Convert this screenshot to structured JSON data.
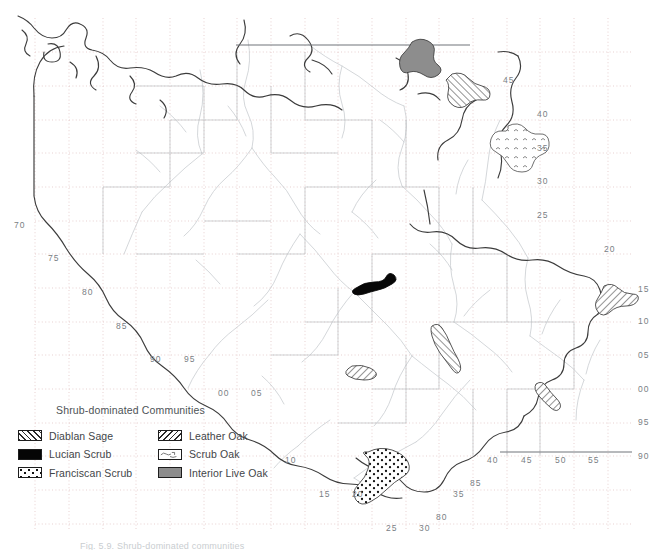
{
  "figure": {
    "caption": "Fig. 5.9. Shrub-dominated communities",
    "background_color": "#ffffff"
  },
  "legend": {
    "title": "Shrub-dominated Communities",
    "columns": [
      {
        "items": [
          {
            "label": "Diablan Sage",
            "pattern": "diagonal-hatch-forward",
            "color": "#2b2b2b"
          },
          {
            "label": "Lucian Scrub",
            "pattern": "solid-black",
            "color": "#050505"
          },
          {
            "label": "Franciscan Scrub",
            "pattern": "stipple-dots",
            "color": "#111111"
          }
        ]
      },
      {
        "items": [
          {
            "label": "Leather Oak",
            "pattern": "diagonal-hatch-back",
            "color": "#2b2b2b"
          },
          {
            "label": "Scrub Oak",
            "pattern": "sparse-marks",
            "color": "#555555"
          },
          {
            "label": "Interior Live Oak",
            "pattern": "solid-gray",
            "color": "#8d8d8d"
          }
        ]
      }
    ]
  },
  "map": {
    "line_colors": {
      "boundary": "#3b3b3b",
      "coastline": "#444444",
      "rivers": "#c2c6c9",
      "county": "#b9bdc0",
      "grid": "#d9a9a9",
      "state_line": "#6f7477"
    },
    "grid_ticks": [
      {
        "id": "t-45",
        "label": "45",
        "x": 503,
        "y": 76
      },
      {
        "id": "t-40a",
        "label": "40",
        "x": 537,
        "y": 110
      },
      {
        "id": "t-35",
        "label": "35",
        "x": 537,
        "y": 144
      },
      {
        "id": "t-30",
        "label": "30",
        "x": 537,
        "y": 177
      },
      {
        "id": "t-25",
        "label": "25",
        "x": 537,
        "y": 211
      },
      {
        "id": "t-20",
        "label": "20",
        "x": 604,
        "y": 245
      },
      {
        "id": "t-15",
        "label": "15",
        "x": 638,
        "y": 285
      },
      {
        "id": "t-10",
        "label": "10",
        "x": 638,
        "y": 317
      },
      {
        "id": "t-05",
        "label": "05",
        "x": 638,
        "y": 351
      },
      {
        "id": "t-00",
        "label": "00",
        "x": 638,
        "y": 385
      },
      {
        "id": "t-95",
        "label": "95",
        "x": 638,
        "y": 418
      },
      {
        "id": "t-90",
        "label": "90",
        "x": 638,
        "y": 452
      },
      {
        "id": "t-70",
        "label": "70",
        "x": 14,
        "y": 221
      },
      {
        "id": "t-75",
        "label": "75",
        "x": 48,
        "y": 254
      },
      {
        "id": "t-80",
        "label": "80",
        "x": 82,
        "y": 288
      },
      {
        "id": "t-85",
        "label": "85",
        "x": 116,
        "y": 322
      },
      {
        "id": "t-90b",
        "label": "90",
        "x": 150,
        "y": 355
      },
      {
        "id": "t-95b",
        "label": "95",
        "x": 184,
        "y": 355
      },
      {
        "id": "t-00b",
        "label": "00",
        "x": 218,
        "y": 389
      },
      {
        "id": "t-05b",
        "label": "05",
        "x": 251,
        "y": 389
      },
      {
        "id": "t-10b",
        "label": "10",
        "x": 285,
        "y": 456
      },
      {
        "id": "t-15b",
        "label": "15",
        "x": 319,
        "y": 490
      },
      {
        "id": "t-20b",
        "label": "20",
        "x": 352,
        "y": 490
      },
      {
        "id": "t-25b",
        "label": "25",
        "x": 386,
        "y": 524
      },
      {
        "id": "t-30b",
        "label": "30",
        "x": 419,
        "y": 524
      },
      {
        "id": "t-35b",
        "label": "35",
        "x": 453,
        "y": 490
      },
      {
        "id": "t-80c",
        "label": "80",
        "x": 436,
        "y": 513
      },
      {
        "id": "t-85c",
        "label": "85",
        "x": 470,
        "y": 479
      },
      {
        "id": "t-40b",
        "label": "40",
        "x": 487,
        "y": 456
      },
      {
        "id": "t-45b",
        "label": "45",
        "x": 521,
        "y": 456
      },
      {
        "id": "t-50b",
        "label": "50",
        "x": 555,
        "y": 456
      },
      {
        "id": "t-55b",
        "label": "55",
        "x": 588,
        "y": 456
      }
    ],
    "features": [
      {
        "name": "interior-live-oak-north",
        "type": "Interior Live Oak",
        "pattern": "solid-gray"
      },
      {
        "name": "leather-oak-north",
        "type": "Leather Oak",
        "pattern": "diagonal-hatch-back"
      },
      {
        "name": "scrub-oak-northeast",
        "type": "Scrub Oak",
        "pattern": "sparse-marks"
      },
      {
        "name": "lucian-scrub-central",
        "type": "Lucian Scrub",
        "pattern": "solid-black"
      },
      {
        "name": "leather-oak-central",
        "type": "Leather Oak",
        "pattern": "diagonal-hatch-back"
      },
      {
        "name": "diablan-sage-central",
        "type": "Diablan Sage",
        "pattern": "diagonal-hatch-forward"
      },
      {
        "name": "diablan-sage-east",
        "type": "Diablan Sage",
        "pattern": "diagonal-hatch-forward"
      },
      {
        "name": "diablan-sage-southeast",
        "type": "Diablan Sage",
        "pattern": "diagonal-hatch-forward"
      },
      {
        "name": "franciscan-scrub-south",
        "type": "Franciscan Scrub",
        "pattern": "stipple-dots"
      }
    ]
  }
}
